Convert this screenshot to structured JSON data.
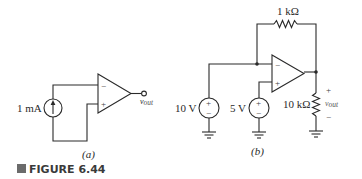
{
  "figure": {
    "label": "FIGURE 6.44",
    "marker_color": "#6b6b6b"
  },
  "circuit_a": {
    "caption": "(a)",
    "current_source": {
      "value": "1 mA",
      "icon": "current-source-up-arrow"
    },
    "opamp": {
      "minus_label": "−",
      "plus_label": "+"
    },
    "output": {
      "label_main": "v",
      "label_sub": "out"
    }
  },
  "circuit_b": {
    "caption": "(b)",
    "feedback_resistor": {
      "value": "1 kΩ"
    },
    "source_1": {
      "value": "10 V",
      "plus": "+",
      "minus": "−"
    },
    "source_2": {
      "value": "5 V",
      "plus": "+",
      "minus": "−"
    },
    "opamp": {
      "minus_label": "−",
      "plus_label": "+"
    },
    "load_resistor": {
      "value": "10 kΩ"
    },
    "output": {
      "plus": "+",
      "minus": "−",
      "label_main": "v",
      "label_sub": "out"
    }
  }
}
